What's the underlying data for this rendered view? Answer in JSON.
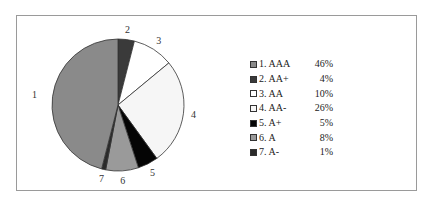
{
  "chart_data": {
    "type": "pie",
    "title": "",
    "categories": [
      "1. AAA",
      "2. AA+",
      "3. AA",
      "4. AA-",
      "5. A+",
      "6. A",
      "7. A-"
    ],
    "values": [
      46,
      4,
      10,
      26,
      5,
      8,
      1
    ],
    "unit": "%",
    "slice_labels": [
      "1",
      "2",
      "3",
      "4",
      "5",
      "6",
      "7"
    ],
    "colors": [
      "#8a8a8a",
      "#3a3a3a",
      "#ffffff",
      "#f6f6f6",
      "#050505",
      "#9a9a9a",
      "#2a2a2a"
    ],
    "legend_position": "right",
    "start_angle_deg": 0,
    "direction": "clockwise",
    "slice_order_clockwise_from_top": [
      2,
      3,
      4,
      5,
      6,
      7,
      1
    ]
  },
  "legend": {
    "items": [
      {
        "label": "1. AAA",
        "pct": "46%"
      },
      {
        "label": "2. AA+",
        "pct": "4%"
      },
      {
        "label": "3. AA",
        "pct": "10%"
      },
      {
        "label": "4. AA-",
        "pct": "26%"
      },
      {
        "label": "5. A+",
        "pct": "5%"
      },
      {
        "label": "6. A",
        "pct": "8%"
      },
      {
        "label": "7. A-",
        "pct": "1%"
      }
    ]
  }
}
